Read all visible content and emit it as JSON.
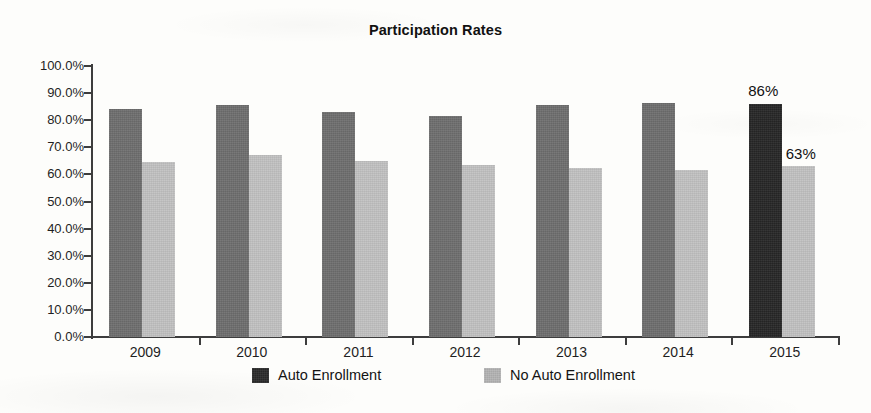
{
  "chart_data": {
    "type": "bar",
    "title": "Participation Rates",
    "xlabel": "",
    "ylabel": "",
    "ylim": [
      0,
      100
    ],
    "grid": false,
    "legend_position": "bottom",
    "categories": [
      "2009",
      "2010",
      "2011",
      "2012",
      "2013",
      "2014",
      "2015"
    ],
    "ytick_labels": [
      "100.0%",
      "90.0%",
      "80.0%",
      "70.0%",
      "60.0%",
      "50.0%",
      "40.0%",
      "30.0%",
      "20.0%",
      "10.0%",
      "0.0%"
    ],
    "ytick_values": [
      100,
      90,
      80,
      70,
      60,
      50,
      40,
      30,
      20,
      10,
      0
    ],
    "series": [
      {
        "name": "Auto Enrollment",
        "color": "#6e6e6e",
        "highlight_color": "#262626",
        "values": [
          84,
          85.5,
          83,
          81.5,
          85.5,
          86.5,
          86
        ]
      },
      {
        "name": "No Auto Enrollment",
        "color": "#c2c2c2",
        "values": [
          64.5,
          67,
          65,
          63.5,
          62.5,
          61.5,
          63
        ]
      }
    ],
    "annotations": [
      {
        "text": "86%",
        "category": "2015",
        "series": "Auto Enrollment",
        "position": "above"
      },
      {
        "text": "63%",
        "category": "2015",
        "series": "No Auto Enrollment",
        "position": "above-left"
      }
    ]
  },
  "legend": {
    "items": [
      {
        "label": "Auto Enrollment",
        "swatch": "dark"
      },
      {
        "label": "No Auto Enrollment",
        "swatch": "light"
      }
    ]
  }
}
